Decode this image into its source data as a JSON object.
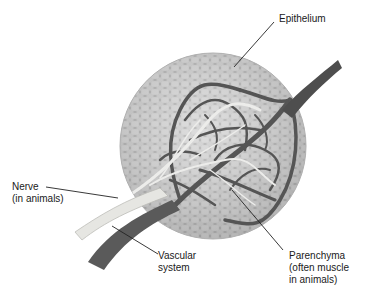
{
  "diagram": {
    "type": "anatomical-illustration",
    "colors": {
      "background": "#ffffff",
      "cells": "#cfcfcf",
      "cell_outline": "#9a9a9a",
      "vascular": "#555555",
      "nerve": "#e6e6e2",
      "leader_line": "#222222",
      "text": "#1a1a1a"
    },
    "labels": {
      "epithelium": {
        "line1": "Epithelium"
      },
      "nerve": {
        "line1": "Nerve",
        "line2": "(in animals)"
      },
      "vascular": {
        "line1": "Vascular",
        "line2": "system"
      },
      "parenchyma": {
        "line1": "Parenchyma",
        "line2": "(often muscle",
        "line3": "in animals)"
      }
    }
  }
}
